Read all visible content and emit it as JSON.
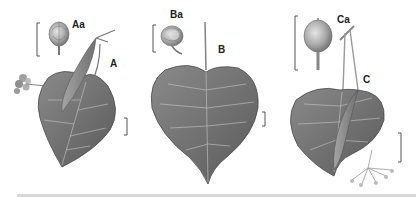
{
  "figure": {
    "colors": {
      "leaf_fill": "#7a7a7a",
      "leaf_dark": "#5e5e5e",
      "vein": "#c8c8c8",
      "fruit_fill": "#9a9a9a",
      "bract_fill": "#8c8c8c",
      "scale_bar": "#555555",
      "background": "#ffffff",
      "bottom_rule": "#d9d9d9"
    },
    "specimens": [
      {
        "id": "A",
        "label": "A",
        "fruit_label": "Aa"
      },
      {
        "id": "B",
        "label": "B",
        "fruit_label": "Ba"
      },
      {
        "id": "C",
        "label": "C",
        "fruit_label": "Ca"
      }
    ]
  }
}
